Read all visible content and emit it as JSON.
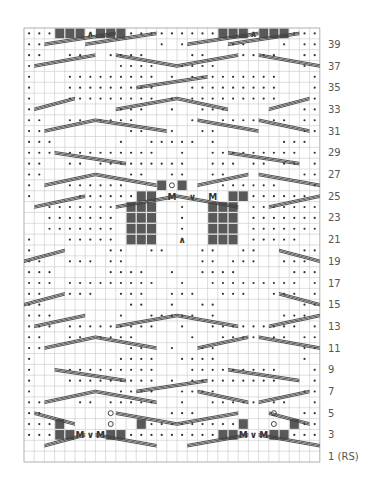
{
  "chart_data": {
    "type": "knitting-chart",
    "columns": 29,
    "rows_count": 40,
    "colors": {
      "grid": "#c8c8c8",
      "grid_border": "#b4b4b4",
      "dot": "#333333",
      "dark_square": "#595959",
      "cable": "#404040",
      "label": "#555555"
    },
    "legend_symbols": {
      ".": "purl-dot",
      " ": "knit-blank",
      "#": "no-stitch-dark-square",
      "M": "make-one",
      "V": "increase",
      "A": "decrease",
      "O": "multiple-increase-stack"
    },
    "rows_top_to_bottom": [
      "...###A###.........###A###...",
      "..           . .    ..   . ..",
      "..  ..  ....    ..   ....  ..",
      ".        ....  ....        . .",
      ".   ......... . .........   .",
      ".   .........   .........   .",
      ".   ......... . .........   .",
      ".        ...  .  ...       ..",
      "..  .. ....     .  .... .. ..",
      "..        ..  .  ..        ..",
      "...      .  ..... .      ...",
      "... .........  .  ......... .",
      "..  .. .........  ... .. .. .",
      "..        ..  ..  ..       ..",
      ".   ......   #O#   ......   .",
      ".    ......## M V M ##......  ",
      "  ....... ###  .  ### .......",
      "  ....... ###  .  ### .......",
      "  ....... ###  .  ### .......",
      ".   ..... ###  A  ### .....  ",
      ".       ..  ..   ..  ..    ..",
      "..  ... ..       .. ...  ...",
      "...     ....  .  ....     ...",
      "... .........  .  ......... .",
      "..  ...  ...  ...  ...  ... .",
      "..        ..  .  ..        ..",
      "...      .  ..... .      ...",
      "... .........  .  ......... .",
      "..  .. ....     .  .... .. ..",
      "..        ..  .  ..        ..",
      ".        ....  ....        .",
      ".   .........   .........   .",
      ".   ......... . .........   .",
      ".        ....  ....        ..",
      "..   .. .....  .  ..... ..  .",
      "..      O     ...       O  ..",
      "...#    O  #.........#  O #...",
      "...##MVM##.........##MVM##..."
    ],
    "cables": [
      [
        2,
        1.5,
        9,
        0.5
      ],
      [
        6,
        1.5,
        13,
        0.5
      ],
      [
        16,
        1.5,
        23,
        0.5
      ],
      [
        20,
        1.5,
        27,
        0.5
      ],
      [
        1,
        3.5,
        7,
        2.5
      ],
      [
        9,
        2.5,
        15,
        3.5
      ],
      [
        15,
        3.5,
        21,
        2.5
      ],
      [
        23,
        2.5,
        29,
        3.5
      ],
      [
        11,
        5.5,
        18,
        4.5
      ],
      [
        1,
        7.5,
        5,
        6.5
      ],
      [
        9,
        7.5,
        15,
        6.5
      ],
      [
        15,
        6.5,
        20,
        7.5
      ],
      [
        24,
        7.5,
        28,
        6.5
      ],
      [
        2,
        9.5,
        7,
        8.5
      ],
      [
        7,
        8.5,
        14,
        9.5
      ],
      [
        17,
        8.5,
        23,
        9.5
      ],
      [
        23,
        8.5,
        28,
        9.5
      ],
      [
        3,
        11.5,
        10,
        12.5
      ],
      [
        20,
        11.5,
        27,
        12.5
      ],
      [
        2,
        14.5,
        7,
        13.5
      ],
      [
        7,
        13.5,
        13,
        14.5
      ],
      [
        17,
        14.5,
        22,
        13.5
      ],
      [
        23,
        13.5,
        29,
        14.5
      ],
      [
        1,
        16.5,
        6,
        15.5
      ],
      [
        9,
        16.5,
        15,
        15.5
      ],
      [
        15,
        15.5,
        21,
        16.5
      ],
      [
        24,
        16.5,
        29,
        15.5
      ],
      [
        0,
        21.5,
        4,
        20.5
      ],
      [
        25,
        20.5,
        29,
        21.5
      ],
      [
        0,
        25.5,
        4,
        24.5
      ],
      [
        25,
        24.5,
        29,
        25.5
      ],
      [
        1,
        27.5,
        6,
        26.5
      ],
      [
        9,
        27.5,
        15,
        26.5
      ],
      [
        15,
        26.5,
        21,
        27.5
      ],
      [
        24,
        27.5,
        29,
        26.5
      ],
      [
        2,
        29.5,
        7,
        28.5
      ],
      [
        7,
        28.5,
        13,
        29.5
      ],
      [
        17,
        29.5,
        22,
        28.5
      ],
      [
        23,
        28.5,
        29,
        29.5
      ],
      [
        3,
        31.5,
        10,
        32.5
      ],
      [
        20,
        31.5,
        27,
        32.5
      ],
      [
        2,
        34.5,
        7,
        33.5
      ],
      [
        7,
        33.5,
        13,
        34.5
      ],
      [
        17,
        33.5,
        22,
        34.5
      ],
      [
        23,
        34.5,
        28,
        33.5
      ],
      [
        1,
        35.5,
        5,
        36.5
      ],
      [
        9,
        35.5,
        15,
        36.5
      ],
      [
        15,
        36.5,
        21,
        35.5
      ],
      [
        24,
        35.5,
        28,
        36.5
      ],
      [
        11,
        33.5,
        18,
        32.5
      ],
      [
        2,
        38.5,
        6,
        37.5
      ],
      [
        7,
        37.5,
        13,
        38.5
      ],
      [
        16,
        38.5,
        22,
        37.5
      ],
      [
        23,
        37.5,
        29,
        38.5
      ]
    ],
    "row_labels": [
      "39",
      "37",
      "35",
      "33",
      "31",
      "29",
      "27",
      "25",
      "23",
      "21",
      "19",
      "17",
      "15",
      "13",
      "11",
      "9",
      "7",
      "5",
      "3",
      "1 (RS)"
    ]
  }
}
